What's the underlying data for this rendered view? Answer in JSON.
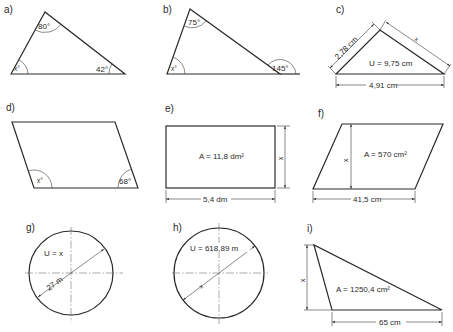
{
  "figures": {
    "a": {
      "label": "a)",
      "type": "triangle",
      "angles": {
        "top": "80°",
        "bottom_right": "42°",
        "bottom_left": "x°"
      }
    },
    "b": {
      "label": "b)",
      "type": "triangle",
      "angles": {
        "top": "75°",
        "exterior_right": "145°",
        "bottom_left": "x°"
      }
    },
    "c": {
      "label": "c)",
      "type": "triangle",
      "side_left": "2,78 cm",
      "side_right": "x",
      "base": "4,91 cm",
      "perimeter": "U = 9,75 cm"
    },
    "d": {
      "label": "d)",
      "type": "parallelogram",
      "angles": {
        "bottom_left": "x°",
        "bottom_right": "68°"
      }
    },
    "e": {
      "label": "e)",
      "type": "rectangle",
      "area": "A = 11,8 dm²",
      "width": "5,4 dm",
      "height": "x"
    },
    "f": {
      "label": "f)",
      "type": "parallelogram",
      "area": "A = 570 cm²",
      "base": "41,5 cm",
      "height": "x"
    },
    "g": {
      "label": "g)",
      "type": "circle",
      "perimeter": "U = x",
      "diameter": "27 m"
    },
    "h": {
      "label": "h)",
      "type": "circle",
      "perimeter": "U = 618,89 m",
      "diameter": "x"
    },
    "i": {
      "label": "i)",
      "type": "triangle",
      "area": "A = 1250,4 cm²",
      "base": "65 cm",
      "height": "x"
    }
  }
}
